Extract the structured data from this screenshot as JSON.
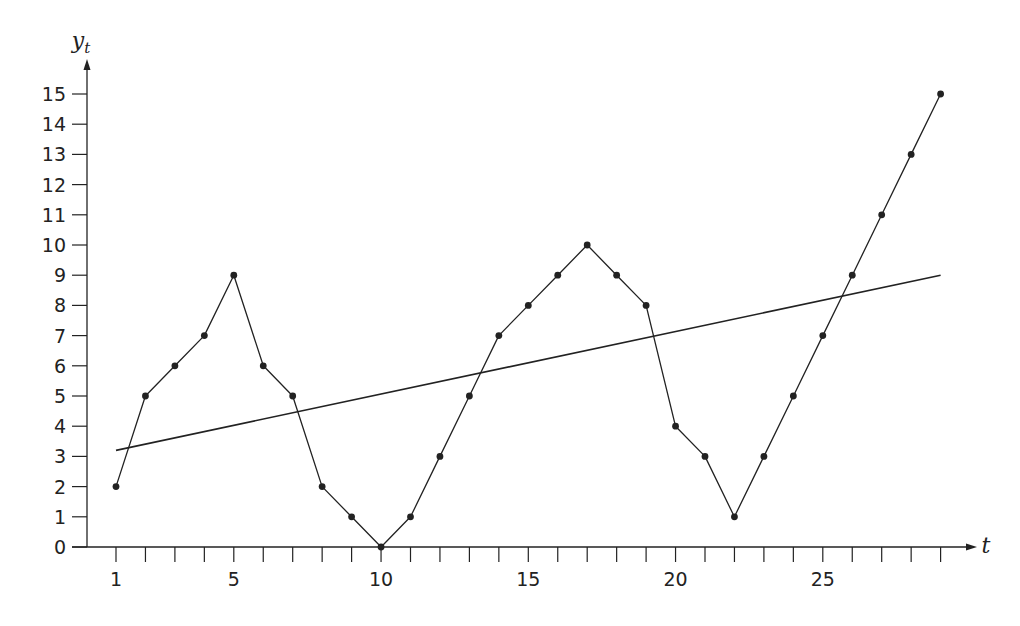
{
  "chart_data": {
    "type": "line",
    "title": "",
    "xlabel": "t",
    "ylabel": "y_t",
    "ylabel_main": "y",
    "ylabel_sub": "t",
    "xlim": [
      0,
      30
    ],
    "ylim": [
      0,
      15
    ],
    "grid": false,
    "legend": null,
    "x_ticks": [
      1,
      2,
      3,
      4,
      5,
      6,
      7,
      8,
      9,
      10,
      11,
      12,
      13,
      14,
      15,
      16,
      17,
      18,
      19,
      20,
      21,
      22,
      23,
      24,
      25,
      26,
      27,
      28,
      29
    ],
    "x_tick_labels": [
      {
        "t": 1,
        "label": "1"
      },
      {
        "t": 5,
        "label": "5"
      },
      {
        "t": 10,
        "label": "10"
      },
      {
        "t": 15,
        "label": "15"
      },
      {
        "t": 20,
        "label": "20"
      },
      {
        "t": 25,
        "label": "25"
      }
    ],
    "y_ticks": [
      0,
      1,
      2,
      3,
      4,
      5,
      6,
      7,
      8,
      9,
      10,
      11,
      12,
      13,
      14,
      15
    ],
    "y_tick_labels": [
      "0",
      "1",
      "2",
      "3",
      "4",
      "5",
      "6",
      "7",
      "8",
      "9",
      "10",
      "11",
      "12",
      "13",
      "14",
      "15"
    ],
    "series": [
      {
        "name": "y_t",
        "style": "line-with-markers",
        "color": "#222222",
        "x": [
          1,
          2,
          3,
          4,
          5,
          6,
          7,
          8,
          9,
          10,
          11,
          12,
          13,
          14,
          15,
          16,
          17,
          18,
          19,
          20,
          21,
          22,
          23,
          24,
          25,
          26,
          27,
          28,
          29
        ],
        "values": [
          2,
          5,
          6,
          7,
          9,
          6,
          5,
          2,
          1,
          0,
          1,
          3,
          5,
          7,
          8,
          9,
          10,
          9,
          8,
          4,
          3,
          1,
          3,
          5,
          7,
          9,
          11,
          13,
          15
        ]
      },
      {
        "name": "linear trend",
        "style": "line",
        "color": "#222222",
        "x": [
          1,
          29
        ],
        "values": [
          3.2,
          9.0
        ]
      }
    ]
  }
}
